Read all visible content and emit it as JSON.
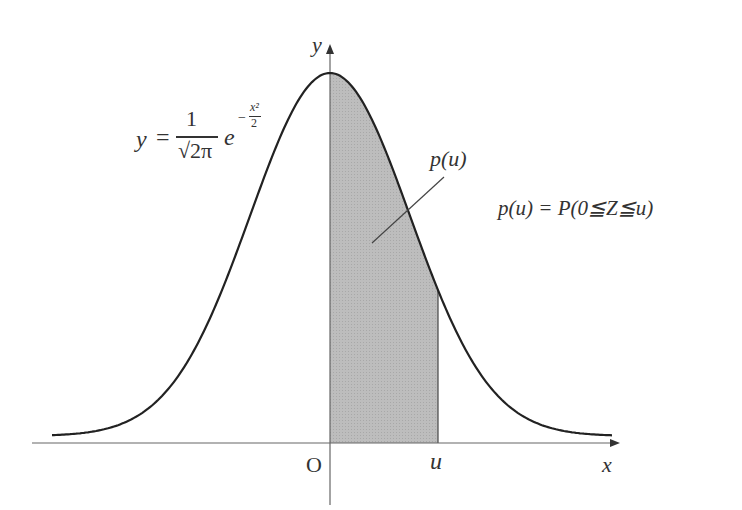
{
  "diagram": {
    "axes": {
      "x_label": "x",
      "y_label": "y",
      "origin_label": "O",
      "u_label": "u"
    },
    "equation": {
      "lhs": "y",
      "eq": "=",
      "numerator": "1",
      "denominator": "√2π",
      "exp_base": "e",
      "exponent": "−x²/2",
      "exp_minus": "−",
      "exp_num": "x²",
      "exp_den": "2"
    },
    "area_label": "p(u)",
    "definition": "p(u) = P(0≦Z≦u)",
    "definition_parts": {
      "p": "p",
      "u1": "(u)",
      "eq": "=",
      "P": "P",
      "arg": "(0≦Z≦u)"
    },
    "colors": {
      "curve": "#222222",
      "axis": "#555555",
      "shade": "#b9b9b9",
      "text": "#333333"
    }
  }
}
